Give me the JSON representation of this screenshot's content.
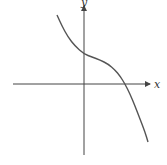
{
  "chart_data": {
    "type": "line",
    "title": "",
    "xlabel": "x",
    "ylabel": "y",
    "grid": false,
    "legend": null,
    "series": [
      {
        "name": "f(x)",
        "points_px": [
          [
            57,
            15
          ],
          [
            62,
            26
          ],
          [
            68,
            37
          ],
          [
            75,
            46
          ],
          [
            84,
            54
          ],
          [
            92,
            57
          ],
          [
            100,
            60
          ],
          [
            108,
            64
          ],
          [
            115,
            70
          ],
          [
            120,
            76
          ],
          [
            125,
            84
          ],
          [
            130,
            94
          ],
          [
            135,
            106
          ],
          [
            140,
            119
          ],
          [
            145,
            132
          ],
          [
            148,
            142
          ]
        ]
      }
    ],
    "features": {
      "y_intercept": "positive",
      "x_intercept": "positive",
      "end_behavior": "falls to the right, rises to the left"
    },
    "colors": {
      "axis": "#444444",
      "curve": "#555555"
    }
  }
}
